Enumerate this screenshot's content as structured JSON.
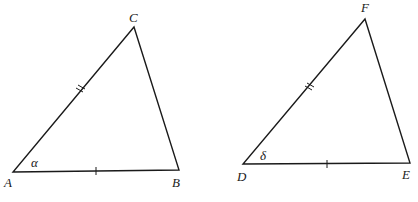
{
  "diagram": {
    "type": "congruent-triangles-SAS",
    "triangles": [
      {
        "name": "triangle-ABC",
        "vertices": {
          "A": [
            13,
            172
          ],
          "B": [
            179,
            170
          ],
          "C": [
            134,
            27
          ]
        },
        "labels": {
          "A": "A",
          "B": "B",
          "C": "C"
        },
        "angle_label": "α",
        "angle_at": "A",
        "single_tick_side": "AB",
        "double_tick_side": "AC"
      },
      {
        "name": "triangle-DEF",
        "vertices": {
          "D": [
            243,
            164
          ],
          "E": [
            410,
            163
          ],
          "F": [
            365,
            19
          ]
        },
        "labels": {
          "D": "D",
          "E": "E",
          "F": "F"
        },
        "angle_label": "δ",
        "angle_at": "D",
        "single_tick_side": "DE",
        "double_tick_side": "DF"
      }
    ]
  }
}
